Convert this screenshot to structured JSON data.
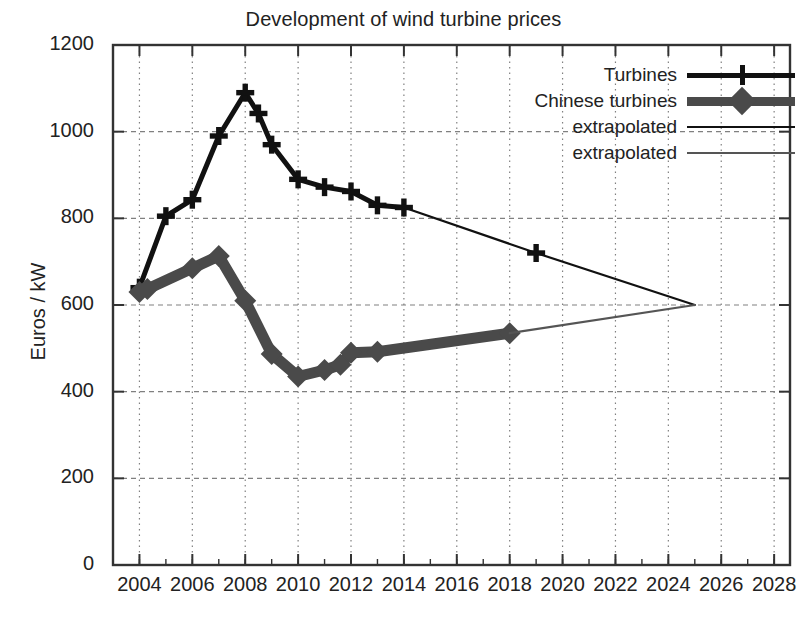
{
  "chart_data": {
    "type": "line",
    "title": "Development of wind turbine prices",
    "xlabel": "",
    "ylabel": "Euros / kW",
    "xlim": [
      2003,
      2028.6
    ],
    "ylim": [
      0,
      1200
    ],
    "xticks": [
      2004,
      2006,
      2008,
      2010,
      2012,
      2014,
      2016,
      2018,
      2020,
      2022,
      2024,
      2026,
      2028
    ],
    "yticks": [
      0,
      200,
      400,
      600,
      800,
      1000,
      1200
    ],
    "grid": true,
    "legend_position": "top-right",
    "series": [
      {
        "name": "Turbines",
        "style": "thick-black-plus",
        "color": "#111111",
        "marker": "plus",
        "x": [
          2004,
          2005,
          2006,
          2007,
          2008,
          2008.5,
          2009,
          2010,
          2011,
          2012,
          2013,
          2014
        ],
        "y": [
          640,
          805,
          843,
          990,
          1090,
          1042,
          970,
          890,
          872,
          862,
          830,
          825
        ]
      },
      {
        "name": "Chinese turbines",
        "style": "thick-gray-diamond",
        "color": "#4a4a4a",
        "marker": "diamond",
        "x": [
          2004,
          2004.3,
          2006,
          2007,
          2008,
          2009,
          2010,
          2011,
          2011.6,
          2012,
          2013,
          2018
        ],
        "y": [
          630,
          637,
          685,
          713,
          610,
          487,
          435,
          450,
          462,
          490,
          492,
          535
        ]
      },
      {
        "name": "extrapolated",
        "style": "thin-black",
        "color": "#111111",
        "marker": "plus",
        "x": [
          2014,
          2019,
          2025
        ],
        "y": [
          825,
          720,
          600
        ]
      },
      {
        "name": "extrapolated",
        "style": "thin-gray",
        "color": "#555555",
        "marker": "none",
        "x": [
          2018,
          2025
        ],
        "y": [
          535,
          600
        ]
      }
    ],
    "legend_entries": [
      {
        "label": "Turbines",
        "key": "thick-black-plus"
      },
      {
        "label": "Chinese turbines",
        "key": "thick-gray-diamond"
      },
      {
        "label": "extrapolated",
        "key": "thin-black"
      },
      {
        "label": "extrapolated",
        "key": "thin-gray"
      }
    ]
  },
  "axis": {
    "y_label": "Euros / kW",
    "y_ticks": [
      "0",
      "200",
      "400",
      "600",
      "800",
      "1000",
      "1200"
    ],
    "x_ticks": [
      "2004",
      "2006",
      "2008",
      "2010",
      "2012",
      "2014",
      "2016",
      "2018",
      "2020",
      "2022",
      "2024",
      "2026",
      "2028"
    ]
  },
  "legend": {
    "items": [
      "Turbines",
      "Chinese turbines",
      "extrapolated",
      "extrapolated"
    ]
  },
  "colors": {
    "turbines": "#111111",
    "chinese_turbines": "#4a4a4a",
    "extrapolated_black": "#111111",
    "extrapolated_gray": "#555555",
    "grid": "#808080",
    "frame": "#333333",
    "background": "#ffffff"
  }
}
